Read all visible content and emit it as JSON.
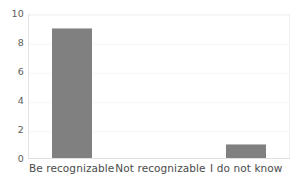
{
  "chart_data": {
    "type": "bar",
    "title": "",
    "subtitle": "",
    "xlabel": "",
    "ylabel": "",
    "categories": [
      "Be recognizable",
      "Not recognizable",
      "I do not know"
    ],
    "values": [
      9,
      0,
      1
    ],
    "series": [
      {
        "name": "",
        "values": [
          9,
          0,
          1
        ]
      }
    ],
    "ylim": [
      0,
      10
    ],
    "ytick_labels": [
      "0",
      "2",
      "4",
      "6",
      "8",
      "10"
    ],
    "ytick_values": [
      0,
      2,
      4,
      6,
      8,
      10
    ],
    "grid": true,
    "grid_axis": "y",
    "legend": false,
    "legend_position": "none",
    "annotations": [],
    "colors": {
      "bar_fill": "#808080",
      "bar_top_edge": "#b9b9b9",
      "gridline": "#f7f7f7",
      "axis_line": "#e0e0e0",
      "tick_text": "#5d5d5d",
      "category_text": "#4a4a4a",
      "background": "#ffffff"
    }
  }
}
